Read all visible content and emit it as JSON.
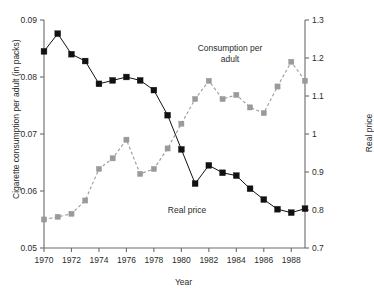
{
  "figure": {
    "background": "#ffffff",
    "width": 367,
    "height": 294
  },
  "axes": {
    "x": {
      "label": "Year",
      "min": 1970,
      "max": 1989,
      "ticks": [
        1970,
        1972,
        1974,
        1976,
        1978,
        1980,
        1982,
        1984,
        1986,
        1988
      ],
      "tick_labels": [
        "1970",
        "1972",
        "1974",
        "1976",
        "1978",
        "1980",
        "1982",
        "1984",
        "1986",
        "1988"
      ]
    },
    "y_left": {
      "label": "Cigarette consumption per adult (in packs)",
      "min": 0.05,
      "max": 0.09,
      "ticks": [
        0.05,
        0.06,
        0.07,
        0.08,
        0.09
      ],
      "tick_labels": [
        "0.05",
        "0.06",
        "0.07",
        "0.08",
        "0.09"
      ]
    },
    "y_right": {
      "label": "Real price",
      "min": 0.7,
      "max": 1.3,
      "ticks": [
        0.7,
        0.8,
        0.9,
        1.0,
        1.1,
        1.2,
        1.3
      ],
      "tick_labels": [
        "0.7",
        "0.8",
        "0.9",
        "1",
        "1.1",
        "1.2",
        "1.3"
      ]
    }
  },
  "annotations": [
    {
      "name": "consumption-annotation",
      "text": "Consumption per\nadult"
    },
    {
      "name": "price-annotation",
      "text": "Real price"
    }
  ],
  "colors": {
    "consumption": "#111111",
    "price": "#9a9a9a",
    "axis": "#6b6b6b",
    "text": "#2b2b2b"
  },
  "chart_data": {
    "type": "line",
    "title": "",
    "xlabel": "Year",
    "ylabel": "Cigarette consumption per adult (in packs)",
    "ylabel_right": "Real price",
    "xlim": [
      1970,
      1989
    ],
    "ylim": [
      0.05,
      0.09
    ],
    "ylim_right": [
      0.7,
      1.3
    ],
    "grid": false,
    "legend": "inline-annotations",
    "x": [
      1970,
      1971,
      1972,
      1973,
      1974,
      1975,
      1976,
      1977,
      1978,
      1979,
      1980,
      1981,
      1982,
      1983,
      1984,
      1985,
      1986,
      1987,
      1988,
      1989
    ],
    "series": [
      {
        "name": "Consumption per adult",
        "axis": "left",
        "color": "#111111",
        "style": "solid",
        "marker": "square",
        "units": "packs",
        "values": [
          0.0845,
          0.0876,
          0.084,
          0.0828,
          0.0788,
          0.0794,
          0.08,
          0.0794,
          0.0777,
          0.0733,
          0.0673,
          0.0613,
          0.0645,
          0.0632,
          0.0627,
          0.0604,
          0.0585,
          0.0568,
          0.0562,
          0.0569
        ]
      },
      {
        "name": "Real price",
        "axis": "right",
        "color": "#9a9a9a",
        "style": "dashed",
        "marker": "square",
        "units": "index",
        "values": [
          0.775,
          0.782,
          0.79,
          0.825,
          0.908,
          0.936,
          0.985,
          0.895,
          0.908,
          0.962,
          1.027,
          1.092,
          1.14,
          1.092,
          1.103,
          1.07,
          1.055,
          1.125,
          1.19,
          1.14
        ]
      }
    ]
  }
}
